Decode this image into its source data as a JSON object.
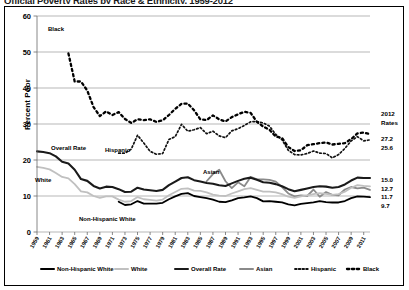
{
  "title": "Official Poverty Rates by Race & Ethnicity, 1959-2012",
  "axes": {
    "ylabel": "Percent Poor",
    "yticks": [
      0,
      10,
      20,
      30,
      40,
      50,
      60
    ],
    "ylim": [
      0,
      60
    ],
    "xticks": [
      "1959",
      "1961",
      "1963",
      "1965",
      "1967",
      "1969",
      "1971",
      "1973",
      "1975",
      "1977",
      "1979",
      "1981",
      "1983",
      "1985",
      "1987",
      "1989",
      "1991",
      "1993",
      "1995",
      "1997",
      "1999",
      "2001",
      "2003",
      "2005",
      "2007",
      "2009",
      "2011"
    ]
  },
  "right_panel": {
    "header_line1": "2012",
    "header_line2": "Rates",
    "values": [
      {
        "series": "Hispanic",
        "value": "27.2"
      },
      {
        "series": "Black",
        "value": "25.6"
      },
      {
        "series": "Asian",
        "value": "15.0"
      },
      {
        "series": "Overall Rate",
        "value": "12.7"
      },
      {
        "series": "White",
        "value": "11.7"
      },
      {
        "series": "Non-Hispanic White",
        "value": "9.7"
      }
    ]
  },
  "annotations": [
    {
      "text": "Black",
      "x": 48,
      "y": 31
    },
    {
      "text": "Overall Rate",
      "x": 51,
      "y": 150
    },
    {
      "text": "Hispanic",
      "x": 105,
      "y": 152
    },
    {
      "text": "White",
      "x": 35,
      "y": 182
    },
    {
      "text": "Asian",
      "x": 203,
      "y": 174
    },
    {
      "text": "Non-Hispanic White",
      "x": 79,
      "y": 221
    }
  ],
  "legend": {
    "items": [
      {
        "label": "Non-Hispanic White",
        "color": "#000000",
        "style": "solid",
        "width": 1.9
      },
      {
        "label": "White",
        "color": "#c0c0c0",
        "style": "solid",
        "width": 1.9
      },
      {
        "label": "Overall Rate",
        "color": "#1a1a1a",
        "style": "solid",
        "width": 2.1
      },
      {
        "label": "Asian",
        "color": "#8a8a8a",
        "style": "solid",
        "width": 1.9
      },
      {
        "label": "Hispanic",
        "color": "#111111",
        "style": "dotted",
        "width": 1.6
      },
      {
        "label": "Black",
        "color": "#000000",
        "style": "dotted",
        "width": 2.2
      }
    ]
  },
  "chart_data": {
    "type": "line",
    "title": "Official Poverty Rates by Race & Ethnicity, 1959-2012",
    "xlabel": "",
    "ylabel": "Percent Poor",
    "ylim": [
      0,
      60
    ],
    "grid": true,
    "legend_position": "bottom",
    "x": [
      1959,
      1960,
      1961,
      1962,
      1963,
      1964,
      1965,
      1966,
      1967,
      1968,
      1969,
      1970,
      1971,
      1972,
      1973,
      1974,
      1975,
      1976,
      1977,
      1978,
      1979,
      1980,
      1981,
      1982,
      1983,
      1984,
      1985,
      1986,
      1987,
      1988,
      1989,
      1990,
      1991,
      1992,
      1993,
      1994,
      1995,
      1996,
      1997,
      1998,
      1999,
      2000,
      2001,
      2002,
      2003,
      2004,
      2005,
      2006,
      2007,
      2008,
      2009,
      2010,
      2011,
      2012
    ],
    "series": [
      {
        "name": "Black",
        "color": "#000000",
        "style": "dotted",
        "values": [
          55.1,
          null,
          null,
          null,
          null,
          49.6,
          41.8,
          41.8,
          39.3,
          34.7,
          32.2,
          33.5,
          32.5,
          33.3,
          31.4,
          30.3,
          31.3,
          31.1,
          31.3,
          30.6,
          31.0,
          32.5,
          34.2,
          35.6,
          35.7,
          33.8,
          31.3,
          31.1,
          32.4,
          31.3,
          30.7,
          31.9,
          32.7,
          33.4,
          33.1,
          30.6,
          29.3,
          28.4,
          26.5,
          26.1,
          23.6,
          22.5,
          22.7,
          24.1,
          24.4,
          24.7,
          24.9,
          24.3,
          24.5,
          24.7,
          25.8,
          27.4,
          27.6,
          27.2
        ]
      },
      {
        "name": "Hispanic",
        "color": "#111111",
        "style": "dotted",
        "values": [
          null,
          null,
          null,
          null,
          null,
          null,
          null,
          null,
          null,
          null,
          null,
          null,
          null,
          21.9,
          21.9,
          23.0,
          26.9,
          24.7,
          22.4,
          21.6,
          21.8,
          25.7,
          26.5,
          29.9,
          28.0,
          28.4,
          29.0,
          27.3,
          28.0,
          26.7,
          26.2,
          28.1,
          28.7,
          29.6,
          30.6,
          30.7,
          30.3,
          29.4,
          27.1,
          25.6,
          22.7,
          21.5,
          21.4,
          21.8,
          22.5,
          21.9,
          21.8,
          20.6,
          21.5,
          23.2,
          25.3,
          26.5,
          25.3,
          25.6
        ]
      },
      {
        "name": "Overall Rate",
        "color": "#1a1a1a",
        "style": "solid",
        "values": [
          22.4,
          22.2,
          21.9,
          21.0,
          19.5,
          19.0,
          17.3,
          14.7,
          14.2,
          12.8,
          12.1,
          12.6,
          12.5,
          11.9,
          11.1,
          11.2,
          12.3,
          11.8,
          11.6,
          11.4,
          11.7,
          13.0,
          14.0,
          15.0,
          15.2,
          14.4,
          14.0,
          13.6,
          13.4,
          13.0,
          12.8,
          13.5,
          14.2,
          14.8,
          15.1,
          14.5,
          13.8,
          13.7,
          13.3,
          12.7,
          11.9,
          11.3,
          11.7,
          12.1,
          12.5,
          12.7,
          12.6,
          12.3,
          12.5,
          13.2,
          14.3,
          15.1,
          15.0,
          15.0
        ]
      },
      {
        "name": "White",
        "color": "#c0c0c0",
        "style": "solid",
        "values": [
          18.1,
          17.8,
          17.4,
          16.4,
          15.3,
          14.9,
          13.3,
          11.3,
          11.0,
          10.0,
          9.5,
          9.9,
          9.9,
          9.0,
          8.4,
          8.6,
          9.7,
          9.1,
          8.9,
          8.7,
          9.0,
          10.2,
          11.1,
          12.0,
          12.1,
          11.5,
          11.4,
          11.0,
          10.4,
          10.1,
          10.0,
          10.7,
          11.3,
          11.9,
          12.2,
          11.7,
          11.2,
          11.2,
          11.0,
          10.5,
          9.8,
          9.5,
          9.9,
          10.2,
          10.5,
          10.8,
          10.6,
          10.3,
          10.5,
          11.2,
          12.3,
          13.0,
          12.8,
          12.7
        ]
      },
      {
        "name": "Asian",
        "color": "#8a8a8a",
        "style": "solid",
        "values": [
          null,
          null,
          null,
          null,
          null,
          null,
          null,
          null,
          null,
          null,
          null,
          null,
          null,
          null,
          null,
          null,
          null,
          null,
          null,
          null,
          null,
          null,
          null,
          null,
          null,
          null,
          null,
          14.1,
          16.1,
          17.3,
          14.1,
          12.2,
          13.8,
          12.7,
          15.3,
          14.6,
          14.6,
          14.5,
          14.0,
          12.5,
          10.7,
          9.9,
          10.2,
          10.0,
          11.8,
          9.8,
          11.1,
          10.3,
          10.2,
          11.8,
          12.5,
          12.1,
          12.3,
          11.7
        ]
      },
      {
        "name": "Non-Hispanic White",
        "color": "#000000",
        "style": "solid",
        "values": [
          null,
          null,
          null,
          null,
          null,
          null,
          null,
          null,
          null,
          null,
          null,
          null,
          null,
          8.4,
          7.5,
          7.7,
          8.6,
          7.9,
          7.9,
          7.9,
          8.1,
          9.1,
          9.9,
          10.6,
          10.8,
          10.0,
          9.7,
          9.4,
          9.0,
          8.4,
          8.3,
          8.8,
          9.4,
          9.6,
          9.9,
          9.4,
          8.5,
          8.6,
          8.4,
          8.2,
          7.7,
          7.4,
          7.8,
          8.0,
          8.2,
          8.6,
          8.3,
          8.2,
          8.2,
          8.6,
          9.4,
          9.9,
          9.8,
          9.7
        ]
      }
    ]
  }
}
